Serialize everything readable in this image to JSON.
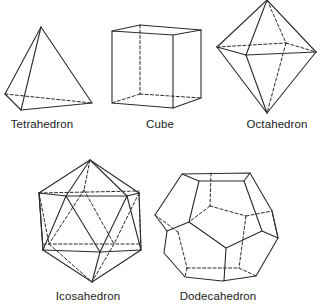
{
  "figure": {
    "solids": [
      {
        "id": "tetrahedron",
        "label": "Tetrahedron",
        "faces": 4
      },
      {
        "id": "cube",
        "label": "Cube",
        "faces": 6
      },
      {
        "id": "octahedron",
        "label": "Octahedron",
        "faces": 8
      },
      {
        "id": "icosahedron",
        "label": "Icosahedron",
        "faces": 20
      },
      {
        "id": "dodecahedron",
        "label": "Dodecahedron",
        "faces": 12
      }
    ],
    "style": {
      "line_color": "#2b2b2b",
      "background": "#ffffff",
      "hidden_edges": "dashed"
    }
  }
}
